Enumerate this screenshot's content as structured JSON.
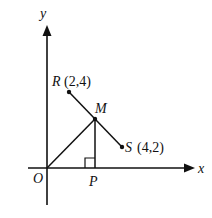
{
  "diagram": {
    "axes": {
      "x_label": "x",
      "y_label": "y",
      "origin_label": "O"
    },
    "points": {
      "R": {
        "label": "R",
        "coords": "(2,4)"
      },
      "S": {
        "label": "S",
        "coords": "(4,2)"
      },
      "M": {
        "label": "M"
      },
      "P": {
        "label": "P"
      }
    },
    "segments": [
      "RS",
      "OM",
      "MP"
    ],
    "right_angle_at": "P",
    "colors": {
      "line": "#111111",
      "background": "#ffffff"
    }
  }
}
